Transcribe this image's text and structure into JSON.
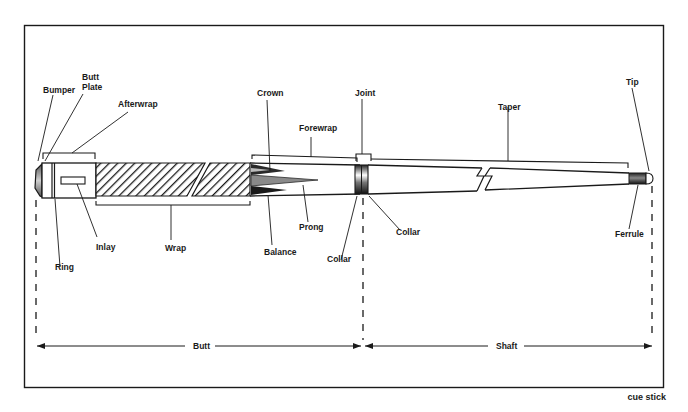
{
  "figure": {
    "caption": "cue stick",
    "labels": {
      "bumper": "Bumper",
      "butt_plate_line1": "Butt",
      "butt_plate_line2": "Plate",
      "afterwrap": "Afterwrap",
      "ring": "Ring",
      "inlay": "Inlay",
      "wrap": "Wrap",
      "crown": "Crown",
      "forewrap": "Forewrap",
      "prong": "Prong",
      "balance": "Balance",
      "joint": "Joint",
      "collar_left": "Collar",
      "collar_right": "Collar",
      "taper": "Taper",
      "tip": "Tip",
      "ferrule": "Ferrule"
    },
    "dimensions": {
      "butt": "Butt",
      "shaft": "Shaft"
    }
  },
  "colors": {
    "ink": "#1a1a1a",
    "background": "#ffffff",
    "shade": "#9a9a9a"
  }
}
